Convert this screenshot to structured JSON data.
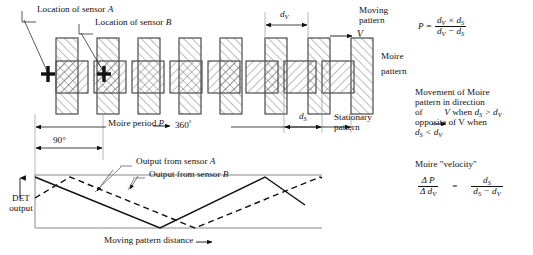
{
  "labels": {
    "sensor_a_callout": "Location of sensor A",
    "sensor_b_callout": "Location of sensor B",
    "d_v": "dV",
    "d_s": "dS",
    "moving_pattern": "Moving pattern",
    "moving_pattern_line1": "Moving",
    "moving_pattern_line2": "pattern",
    "velocity_symbol": "V",
    "moire_pattern_line1": "Moire",
    "moire_pattern_line2": "pattern",
    "stationary_pattern_line1": "Stationary",
    "stationary_pattern_line2": "pattern",
    "moire_period": "Moire period P",
    "degrees_360": "360",
    "degrees_360_unit": "°",
    "degrees_90": "90°",
    "output_sensor_a": "Output from sensor A",
    "output_sensor_b": "Output from sensor B",
    "det_output_line1": "DET",
    "det_output_line2": "output",
    "x_axis": "Moving pattern distance"
  },
  "notes": {
    "movement_line1": "Movement of Moire",
    "movement_line2": "pattern in direction",
    "movement_line3_a": "of",
    "movement_line3_b": "V",
    "movement_line3_c": "when",
    "movement_line3_d": "dS > dV",
    "movement_line4": "opposite of V when",
    "movement_line5": "dS < dV",
    "velocity_heading": "Moire \"velocity\""
  },
  "equations": {
    "period_lhs": "P =",
    "period_num": "dV × dS",
    "period_den": "dV − dS",
    "velocity_num_left": "Δ P",
    "velocity_den_left": "Δ dV",
    "velocity_eq": "=",
    "velocity_num_right": "dS",
    "velocity_den_right": "dS − dV"
  },
  "colors": {
    "ink": "#111111",
    "hatch": "#6d6d6d",
    "outline": "#555555",
    "axis": "#777777"
  },
  "chart_data": {
    "type": "line",
    "xlabel": "Moving pattern distance",
    "ylabel": "DET output",
    "grid": false,
    "legend": [
      "Output from sensor A",
      "Output from sensor B"
    ],
    "legend_position": "inside-top-right",
    "xlim": [
      0,
      360
    ],
    "ylim": [
      0,
      1
    ],
    "annotations": [
      "Moire period P = 360°",
      "90°"
    ],
    "series": [
      {
        "name": "Output from sensor A",
        "style": "solid",
        "x": [
          0,
          135,
          270,
          360
        ],
        "y": [
          1.0,
          0.0,
          1.0,
          0.33
        ]
      },
      {
        "name": "Output from sensor B",
        "style": "dashed",
        "x": [
          0,
          45,
          180,
          315,
          360
        ],
        "y": [
          0.62,
          1.0,
          0.0,
          1.0,
          0.86
        ]
      }
    ]
  },
  "pattern": {
    "description": "Overlap of tall hatched moving-pattern bars with wider shorter stationary-pattern bars producing cross-hatched moire cells",
    "moving_bar_count": 12,
    "stationary_bar_count": 6
  }
}
